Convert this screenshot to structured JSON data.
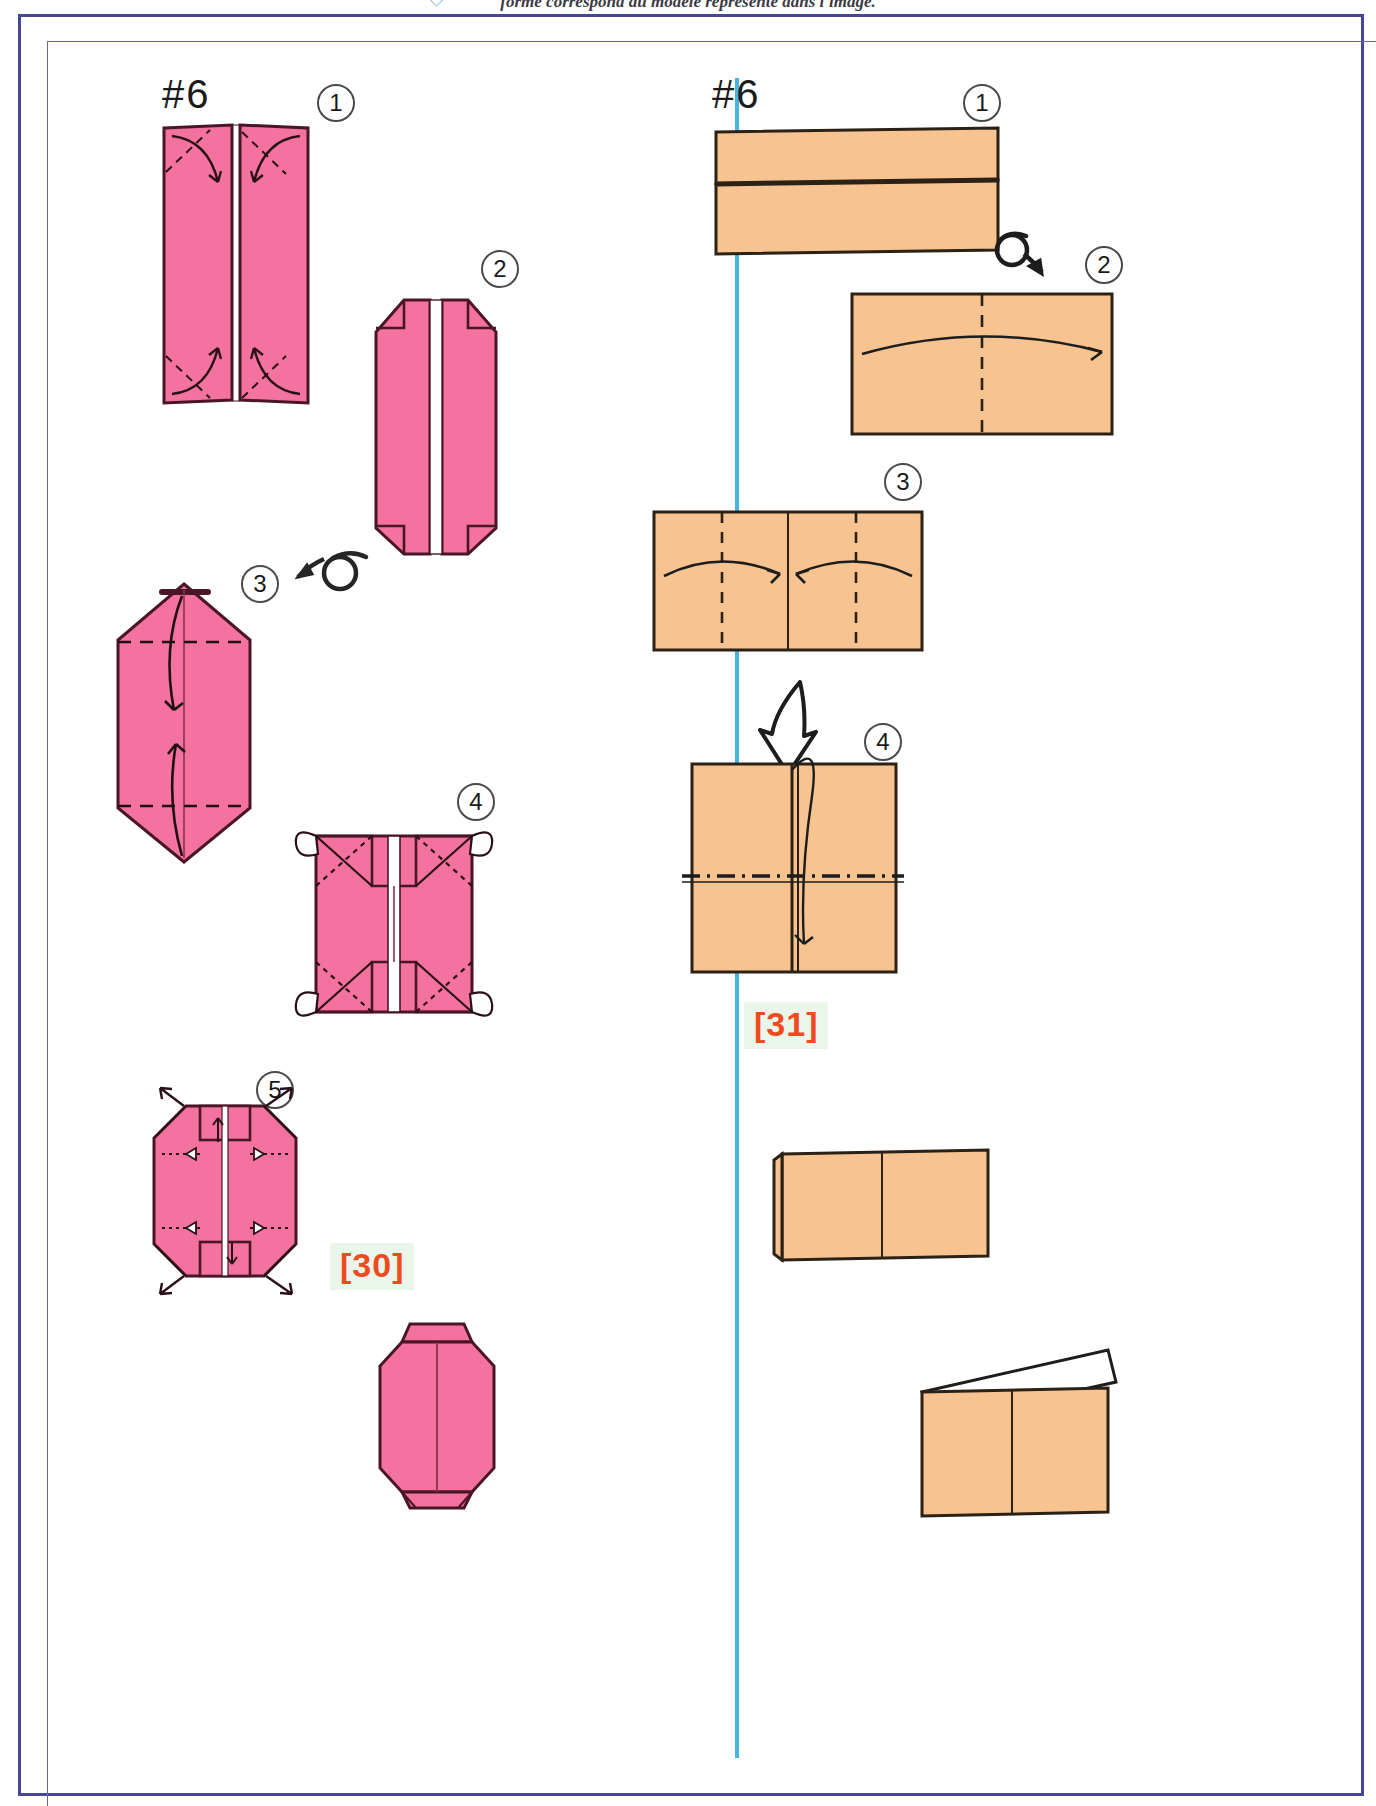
{
  "page": {
    "running_header": "forme correspond au modèle représenté dans l'image.",
    "frame_color": "#45469a",
    "divider_color": "#49b4e4",
    "background": "#ffffff"
  },
  "colors": {
    "pink_fill": "#f4729f",
    "pink_stroke": "#4a1526",
    "orange_fill": "#f6c391",
    "orange_stroke": "#2b2115",
    "ink": "#1a1a1a",
    "ref_text": "#f04a20",
    "ref_highlight": "#eaf6ea"
  },
  "columns": [
    {
      "id": "left-column",
      "model_title": "#6",
      "paper_color": "pink",
      "ref_tag": "[30]",
      "steps": [
        {
          "number": "1",
          "name": "fold-corners-inward",
          "description": "Two tall pink panels side by side with diagonal valley folds at the four corners; curved arrows fold corners inward."
        },
        {
          "number": "2",
          "name": "corners-folded-result",
          "description": "Tall pink shape with top and bottom corners folded, narrow white gap along the vertical centre."
        },
        {
          "number": "3",
          "name": "fold-top-and-bottom-down",
          "description": "Pink hexagonal panel with horizontal dashed fold lines near top and bottom; arrows fold the top point down and the bottom point up."
        },
        {
          "number": "4",
          "name": "inside-reverse-fold-corners",
          "description": "Squat pink rectangle with X shaped dotted creases at each corner and four small white ear flaps at the corners."
        },
        {
          "number": "5",
          "name": "pull-out-corner-points",
          "description": "Octagonal pink shape with push/pull arrows at the top and bottom tabs pointing outward diagonally."
        }
      ],
      "final_figure": {
        "name": "finished-pink-model",
        "description": "Finished octagonal pink lantern form with a small tab at the top and bottom."
      },
      "turn_over_icon": {
        "name": "turn-over-icon",
        "position": "between step 2 and step 3",
        "direction": "left"
      }
    },
    {
      "id": "right-column",
      "model_title": "#6",
      "paper_color": "orange",
      "ref_tag": "[31]",
      "steps": [
        {
          "number": "1",
          "name": "folded-in-half-strip",
          "description": "Wide orange rectangle folded in half lengthwise; a dark horizontal line marks the folded edge."
        },
        {
          "number": "2",
          "name": "fold-right-edge-to-left",
          "description": "Wide orange rectangle with a vertical dashed centre crease; a long curved arrow sweeps from the left edge across to the right edge."
        },
        {
          "number": "3",
          "name": "fold-edges-to-centre",
          "description": "Wide orange rectangle with three vertical dashed creases; two curved arrows bring the outer edges in to the centre line."
        },
        {
          "number": "4",
          "name": "fold-in-half-downward",
          "description": "Orange square with a vertical centre seam and a horizontal dash-dot fold line; a looping arrow folds the front flap downward."
        }
      ],
      "big_arrow_icon": {
        "name": "large-down-arrow-icon",
        "description": "Large hollow curved arrow pointing down, between step 3 and step 4."
      },
      "turn_over_icon": {
        "name": "turn-over-icon",
        "position": "right of step 1",
        "direction": "right"
      },
      "result_figures": [
        {
          "name": "orange-result-book-form",
          "description": "Orange rectangle standing like a partly opened book with a vertical centre seam."
        },
        {
          "name": "orange-result-with-white-flap",
          "description": "Orange rectangle with a white paper flap lifting from its top-right corner."
        }
      ]
    }
  ]
}
